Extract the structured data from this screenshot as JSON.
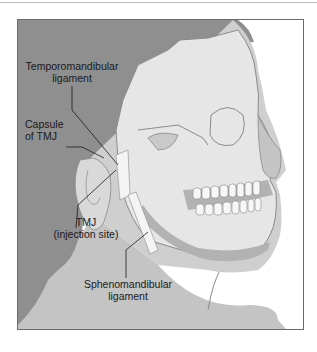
{
  "figure": {
    "type": "anatomical-illustration",
    "colors": {
      "background": "#ffffff",
      "hair": "#8f8f8f",
      "skin": "#c4c4c4",
      "skull": "#e6e6e6",
      "skull_outline": "#8a8a8a",
      "gum": "#b2b2b2",
      "teeth": "#f7f7f7",
      "ligament": "#f4f4f4",
      "frame": "#6a6a6a",
      "label_text": "#1a1a1a"
    },
    "labels": {
      "temporomandibular_line1": "Temporomandibular",
      "temporomandibular_line2": "ligament",
      "capsule_line1": "Capsule",
      "capsule_line2": "of TMJ",
      "tmj_line1": "TMJ",
      "tmj_line2": "(injection site)",
      "spheno_line1": "Sphenomandibular",
      "spheno_line2": "ligament"
    }
  }
}
